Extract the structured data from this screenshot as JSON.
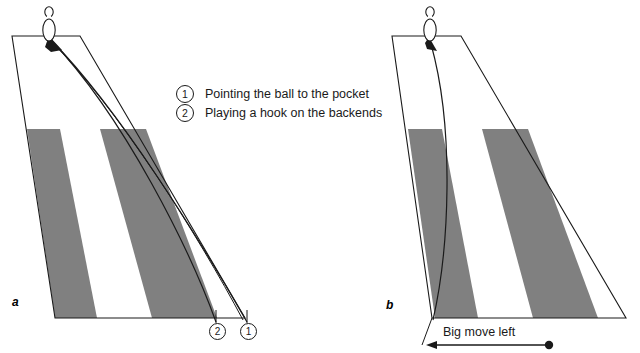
{
  "figure": {
    "type": "diagram",
    "background_color": "#ffffff",
    "line_color": "#1a1a1a",
    "oil_band_color": "#808080"
  },
  "legend": {
    "items": [
      {
        "number": "1",
        "label": "Pointing the ball to the pocket"
      },
      {
        "number": "2",
        "label": "Playing a hook on the backends"
      }
    ]
  },
  "panels": [
    {
      "id": "a",
      "label": "a",
      "pin_name": "bowling-pin",
      "path_markers": [
        {
          "number": "2"
        },
        {
          "number": "1"
        }
      ]
    },
    {
      "id": "b",
      "label": "b",
      "pin_name": "bowling-pin",
      "annotation": {
        "label": "Big move left",
        "arrow_direction": "left"
      }
    }
  ],
  "markers": {
    "two": "2",
    "one": "1"
  },
  "annotation": {
    "big_move_left": "Big move left"
  }
}
